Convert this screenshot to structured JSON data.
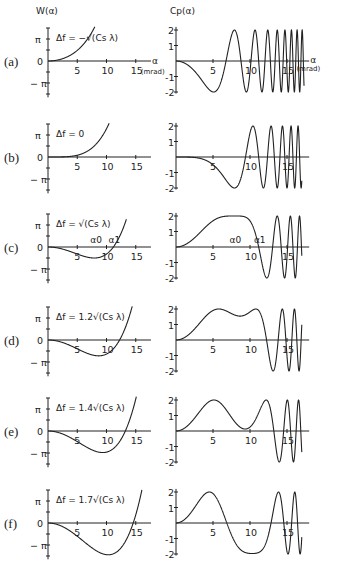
{
  "figure": {
    "left_title": "W(α)",
    "right_title": "Cp(α)",
    "x_axis_label": "α",
    "x_axis_unit": "(mrad)",
    "pi_label": "π",
    "neg_pi_label": "− π",
    "zero_label": "0"
  },
  "chart_data": [
    {
      "type": "line",
      "title": "W(α) phase shift vs scattering angle",
      "xlabel": "α (mrad)",
      "ylabel": "W(α)",
      "xlim": [
        0,
        17
      ],
      "ylim": [
        -4.7,
        4.7
      ],
      "x_ticks": [
        "5",
        "10",
        "15"
      ],
      "y_ticks": [
        "π",
        "0",
        "−π"
      ],
      "model": "W(α) = (π/2)·((α/α_s)^4 − 2·d·(α/α_s)^2), α_s ≈ 7.9 mrad",
      "alpha_s": 7.9,
      "panels": [
        {
          "label": "(a)",
          "defocus_label": "Δf = −√(Cs λ)",
          "d": -1.0,
          "x_end": 8.6,
          "points": [
            [
              0,
              0
            ],
            [
              2,
              0.0
            ],
            [
              4,
              0.87
            ],
            [
              6,
              2.99
            ],
            [
              8.6,
              5.6
            ]
          ]
        },
        {
          "label": "(b)",
          "defocus_label": "Δf = 0",
          "d": 0.0,
          "x_end": 10.6,
          "points": [
            [
              0,
              0
            ],
            [
              5,
              0.25
            ],
            [
              8,
              1.65
            ],
            [
              10,
              4.0
            ],
            [
              10.6,
              5.1
            ]
          ]
        },
        {
          "label": "(c)",
          "defocus_label": "Δf = √(Cs λ)",
          "d": 1.0,
          "x_end": 13.4,
          "annotations": [
            "α0",
            "α1"
          ],
          "alpha0": 7.9,
          "alpha1": 11.2,
          "points": [
            [
              0,
              0
            ],
            [
              5,
              -0.99
            ],
            [
              7.9,
              -1.57
            ],
            [
              11.2,
              0
            ],
            [
              13.4,
              4.7
            ]
          ]
        },
        {
          "label": "(d)",
          "defocus_label": "Δf = 1.2√(Cs λ)",
          "d": 1.2,
          "x_end": 14.5,
          "points": [
            [
              0,
              0
            ],
            [
              5,
              -1.24
            ],
            [
              8.7,
              -2.26
            ],
            [
              12.2,
              0
            ],
            [
              14.5,
              4.7
            ]
          ]
        },
        {
          "label": "(e)",
          "defocus_label": "Δf = 1.4√(Cs λ)",
          "d": 1.4,
          "x_end": 15.2,
          "points": [
            [
              0,
              0
            ],
            [
              5,
              -1.49
            ],
            [
              9.3,
              -3.08
            ],
            [
              13.2,
              0
            ],
            [
              15.2,
              4.7
            ]
          ]
        },
        {
          "label": "(f)",
          "defocus_label": "Δf = 1.7√(Cs λ)",
          "d": 1.7,
          "x_end": 16.1,
          "points": [
            [
              0,
              0
            ],
            [
              5,
              -1.86
            ],
            [
              10.3,
              -4.54
            ],
            [
              14.6,
              0
            ],
            [
              16.1,
              4.7
            ]
          ]
        }
      ]
    },
    {
      "type": "line",
      "title": "Cp(α) phase contrast transfer function",
      "xlabel": "α (mrad)",
      "ylabel": "Cp(α)",
      "xlim": [
        0,
        17
      ],
      "ylim": [
        -2,
        2
      ],
      "x_ticks": [
        "5",
        "10",
        "15"
      ],
      "y_ticks": [
        "2",
        "1",
        "-1",
        "-2"
      ],
      "model": "Cp(α) = −2·sin W(α)",
      "x_end": 17.0,
      "panels": [
        {
          "label": "(a)",
          "d": -1.0,
          "points": [
            [
              0,
              0
            ],
            [
              5,
              -1.96
            ],
            [
              7.2,
              0.2
            ],
            [
              8.6,
              1.98
            ],
            [
              9.9,
              0
            ],
            [
              11,
              -1.9
            ]
          ]
        },
        {
          "label": "(b)",
          "d": 0.0,
          "points": [
            [
              0,
              0
            ],
            [
              5,
              -0.5
            ],
            [
              7.9,
              -2.0
            ],
            [
              9.3,
              0
            ],
            [
              10.6,
              2.0
            ]
          ]
        },
        {
          "label": "(c)",
          "d": 1.0,
          "annotations": [
            "α0",
            "α1"
          ],
          "points": [
            [
              0,
              0
            ],
            [
              5,
              1.67
            ],
            [
              7.9,
              2.0
            ],
            [
              11.2,
              0
            ],
            [
              12.5,
              -2.0
            ],
            [
              13.6,
              2.0
            ]
          ]
        },
        {
          "label": "(d)",
          "d": 1.2,
          "points": [
            [
              0,
              0
            ],
            [
              5.6,
              2.0
            ],
            [
              8.7,
              1.55
            ],
            [
              10.9,
              2.0
            ],
            [
              12.2,
              0
            ],
            [
              13.2,
              -2.0
            ]
          ]
        },
        {
          "label": "(e)",
          "d": 1.4,
          "points": [
            [
              0,
              0
            ],
            [
              5,
              1.99
            ],
            [
              9.3,
              0.12
            ],
            [
              12,
              2.0
            ],
            [
              13.2,
              0
            ],
            [
              14,
              -2.0
            ]
          ]
        },
        {
          "label": "(f)",
          "d": 1.7,
          "points": [
            [
              0,
              0
            ],
            [
              4.4,
              2.0
            ],
            [
              6.9,
              0
            ],
            [
              10.3,
              -1.97
            ],
            [
              12.8,
              0
            ],
            [
              13.7,
              2.0
            ]
          ]
        }
      ]
    }
  ]
}
